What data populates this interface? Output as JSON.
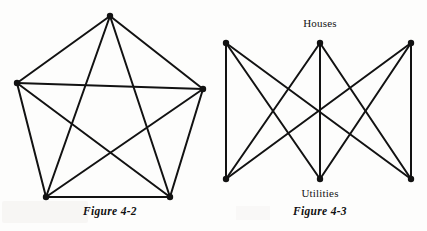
{
  "page": {
    "background_color": "#fdfdfc",
    "ink_color": "#121212"
  },
  "figures": [
    {
      "id": "figure-4-2",
      "caption": "Figure 4-2",
      "graph_name": "K5",
      "description": "Complete graph on five vertices drawn as a pentagon with all five diagonals forming a pentagram",
      "vertex_count": 5,
      "edge_count": 10,
      "labels": []
    },
    {
      "id": "figure-4-3",
      "caption": "Figure 4-3",
      "graph_name": "K3,3",
      "description": "Complete bipartite graph with three houses on top and three utilities on the bottom, every house joined to every utility",
      "vertex_count": 6,
      "edge_count": 9,
      "labels": [
        {
          "text": "Houses",
          "position": "top"
        },
        {
          "text": "Utilities",
          "position": "bottom"
        }
      ],
      "top_label": "Houses",
      "bottom_label": "Utilities"
    }
  ],
  "chart_data": {
    "type": "diagram",
    "title": "",
    "diagrams": [
      {
        "name": "Figure 4-2",
        "graph": "K5",
        "nodes": [
          {
            "id": "A",
            "x": 110,
            "y": 16
          },
          {
            "id": "B",
            "x": 17,
            "y": 83
          },
          {
            "id": "C",
            "x": 203,
            "y": 89
          },
          {
            "id": "D",
            "x": 46,
            "y": 197
          },
          {
            "id": "E",
            "x": 170,
            "y": 197
          }
        ],
        "edges": [
          [
            "A",
            "B"
          ],
          [
            "A",
            "C"
          ],
          [
            "A",
            "D"
          ],
          [
            "A",
            "E"
          ],
          [
            "B",
            "C"
          ],
          [
            "B",
            "D"
          ],
          [
            "B",
            "E"
          ],
          [
            "C",
            "D"
          ],
          [
            "C",
            "E"
          ],
          [
            "D",
            "E"
          ]
        ]
      },
      {
        "name": "Figure 4-3",
        "graph": "K3,3",
        "nodes": [
          {
            "id": "H1",
            "x": 226,
            "y": 43,
            "group": "Houses"
          },
          {
            "id": "H2",
            "x": 320,
            "y": 43,
            "group": "Houses"
          },
          {
            "id": "H3",
            "x": 411,
            "y": 43,
            "group": "Houses"
          },
          {
            "id": "U1",
            "x": 226,
            "y": 179,
            "group": "Utilities"
          },
          {
            "id": "U2",
            "x": 320,
            "y": 179,
            "group": "Utilities"
          },
          {
            "id": "U3",
            "x": 411,
            "y": 179,
            "group": "Utilities"
          }
        ],
        "edges": [
          [
            "H1",
            "U1"
          ],
          [
            "H1",
            "U2"
          ],
          [
            "H1",
            "U3"
          ],
          [
            "H2",
            "U1"
          ],
          [
            "H2",
            "U2"
          ],
          [
            "H2",
            "U3"
          ],
          [
            "H3",
            "U1"
          ],
          [
            "H3",
            "U2"
          ],
          [
            "H3",
            "U3"
          ]
        ]
      }
    ]
  }
}
